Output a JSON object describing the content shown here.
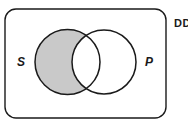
{
  "diagram": {
    "type": "venn",
    "universe": {
      "label": "DD"
    },
    "sets": [
      {
        "id": "S",
        "label": "S",
        "shaded": "only"
      },
      {
        "id": "P",
        "label": "P",
        "shaded": "none"
      }
    ],
    "shaded_region": "S minus P",
    "colors": {
      "stroke": "#1a1a1a",
      "shade": "#c9c9c9",
      "background": "#ffffff"
    }
  }
}
